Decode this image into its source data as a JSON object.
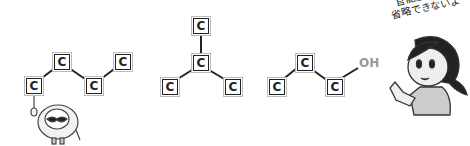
{
  "diagram": {
    "atom_symbol": "C",
    "functional_group": "OH",
    "structures": [
      {
        "name": "butane-chain",
        "atoms": 4
      },
      {
        "name": "isobutane-branch",
        "atoms": 4
      },
      {
        "name": "propanol-chain",
        "atoms": 3,
        "group": "OH"
      }
    ]
  },
  "speech_bubble": {
    "line1": "官能基は",
    "line2": "省略できないよ"
  },
  "colors": {
    "bond": "#222222",
    "atom_border": "#222222",
    "oh_label": "#999999"
  }
}
